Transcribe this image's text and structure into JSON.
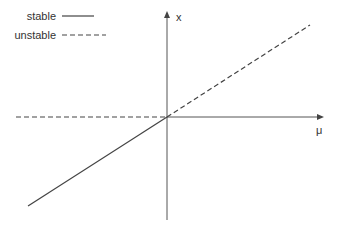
{
  "diagram": {
    "type": "bifurcation-diagram",
    "axes": {
      "x_label": "μ",
      "y_label": "x"
    },
    "legend": {
      "items": [
        {
          "label": "stable",
          "style": "solid"
        },
        {
          "label": "unstable",
          "style": "dashed"
        }
      ]
    },
    "branches": [
      {
        "name": "x=0 for mu<0",
        "style": "dashed",
        "stability": "unstable"
      },
      {
        "name": "x=mu for mu<0",
        "style": "solid",
        "stability": "stable"
      },
      {
        "name": "x=0 for mu>0",
        "style": "solid",
        "stability": "stable"
      },
      {
        "name": "x=mu for mu>0",
        "style": "dashed",
        "stability": "unstable"
      }
    ],
    "colors": {
      "line": "#444444",
      "axis": "#555555",
      "text": "#333333"
    }
  }
}
